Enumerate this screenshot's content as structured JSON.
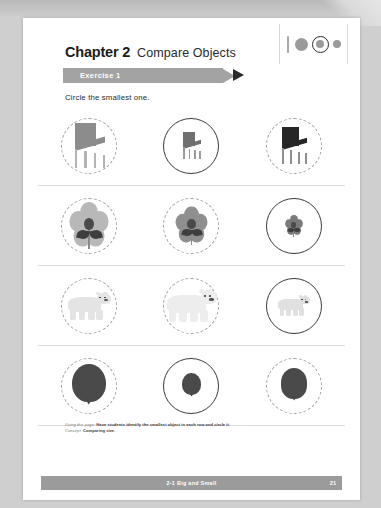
{
  "header": {
    "chapter_number": "Chapter 2",
    "chapter_subject": "Compare Objects",
    "exercise_label": "Exercise 1",
    "progress_icon": "size-progression-icon"
  },
  "instruction": {
    "text": "Circle the smallest one."
  },
  "exercise_rows": [
    {
      "name": "chairs",
      "object": "chair",
      "answer_index": 1,
      "items": [
        {
          "size": "large",
          "scale": 1.0,
          "color": "#8c8c8c",
          "leg_color": "#b4b4b4",
          "circled": false
        },
        {
          "size": "small",
          "scale": 0.58,
          "color": "#6f6f6f",
          "leg_color": "#9a9a9a",
          "circled": true
        },
        {
          "size": "medium",
          "scale": 0.82,
          "color": "#262626",
          "leg_color": "#8e8e8e",
          "circled": false
        }
      ]
    },
    {
      "name": "flowers",
      "object": "flower",
      "answer_index": 2,
      "items": [
        {
          "size": "large",
          "scale": 1.0,
          "color": "#b8b8b8",
          "circled": false
        },
        {
          "size": "medium",
          "scale": 0.8,
          "color": "#8f8f8f",
          "circled": false
        },
        {
          "size": "small",
          "scale": 0.46,
          "color": "#7a7a7a",
          "circled": true
        }
      ]
    },
    {
      "name": "bears",
      "object": "bear",
      "answer_index": 2,
      "items": [
        {
          "size": "medium",
          "scale": 0.84,
          "color": "#e4e4e4",
          "circled": false
        },
        {
          "size": "large",
          "scale": 1.0,
          "color": "#ededed",
          "circled": false
        },
        {
          "size": "small",
          "scale": 0.62,
          "color": "#e0e0e0",
          "circled": true
        }
      ]
    },
    {
      "name": "balloons",
      "object": "balloon",
      "answer_index": 1,
      "items": [
        {
          "size": "large",
          "scale": 1.0,
          "color": "#4a4a4a",
          "circled": false
        },
        {
          "size": "small",
          "scale": 0.56,
          "color": "#4a4a4a",
          "circled": true
        },
        {
          "size": "medium",
          "scale": 0.78,
          "color": "#4a4a4a",
          "circled": false
        }
      ]
    }
  ],
  "teacher_note": {
    "line1_lead": "Using this page:",
    "line1_text": "Have students identify the smallest object in each row and circle it.",
    "line2_lead": "Concept:",
    "line2_text": "Comparing size."
  },
  "footer": {
    "title": "2-1  Big and Small",
    "page_number": "21"
  },
  "colors": {
    "banner": "#a3a3a3",
    "footer_bar": "#9b9b9b",
    "answer_circle": "#3a3a3a",
    "guide_circle": "#9f9f9f"
  }
}
